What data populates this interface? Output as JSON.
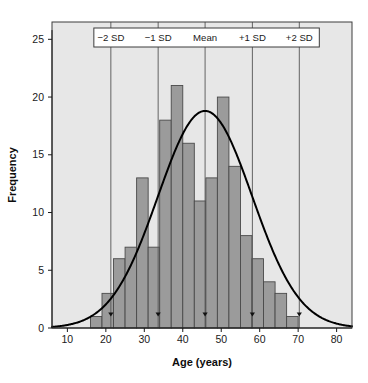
{
  "chart_data": {
    "type": "bar",
    "title": "",
    "subtitle": "",
    "xlabel": "Age (years)",
    "ylabel": "Frequency",
    "xlim": [
      6,
      84
    ],
    "ylim": [
      0,
      26.5
    ],
    "xticks": [
      10,
      20,
      30,
      40,
      50,
      60,
      70,
      80
    ],
    "xtick_labels": [
      "10",
      "20",
      "30",
      "40",
      "50",
      "60",
      "70",
      "80"
    ],
    "yticks": [
      0,
      5,
      10,
      15,
      20,
      25
    ],
    "ytick_labels": [
      "0",
      "5",
      "10",
      "15",
      "20",
      "25"
    ],
    "grid": false,
    "legend_position": "top-inside",
    "bin_width": 3,
    "bin_starts": [
      16,
      19,
      22,
      25,
      28,
      31,
      34,
      37,
      40,
      43,
      46,
      49,
      52,
      55,
      58,
      61,
      64,
      67,
      70,
      73
    ],
    "categories": [
      "16-19",
      "19-22",
      "22-25",
      "25-28",
      "28-31",
      "31-34",
      "34-37",
      "37-40",
      "40-43",
      "43-46",
      "46-49",
      "49-52",
      "52-55",
      "55-58",
      "58-61",
      "61-64",
      "64-67",
      "67-70",
      "70-73",
      "73-76"
    ],
    "values": [
      1,
      3,
      6,
      7,
      13,
      7,
      18,
      21,
      16,
      11,
      13,
      20,
      14,
      8,
      6,
      4,
      3,
      1,
      0,
      0
    ],
    "series": [
      {
        "name": "Frequency",
        "type": "bar",
        "values": [
          1,
          3,
          6,
          7,
          13,
          7,
          18,
          21,
          16,
          11,
          13,
          20,
          14,
          8,
          6,
          4,
          3,
          1,
          0,
          0
        ],
        "fill_color": "#9b9b9b",
        "edge_color": "#4a4a4a"
      },
      {
        "name": "Normal curve",
        "type": "line",
        "mean": 45.8,
        "sd": 12.25,
        "peak_height": 18.8,
        "line_color": "#000000",
        "line_width": 2
      }
    ],
    "reference_lines": [
      {
        "label": "−2 SD",
        "x": 21.3
      },
      {
        "label": "−1 SD",
        "x": 33.6
      },
      {
        "label": "Mean",
        "x": 45.8
      },
      {
        "label": "+1 SD",
        "x": 58.1
      },
      {
        "label": "+2 SD",
        "x": 70.3
      }
    ],
    "marker_y": 1.0,
    "colors": {
      "plot_background": "#e7e7e7",
      "figure_background": "#ffffff",
      "bar_fill": "#9b9b9b",
      "bar_edge": "#4a4a4a",
      "curve": "#000000",
      "reference_line": "#555555",
      "legend_box_fill": "#ffffff",
      "legend_box_edge": "#3c3c3c",
      "axis": "#1a1a1a",
      "text": "#1a1a1a"
    }
  }
}
